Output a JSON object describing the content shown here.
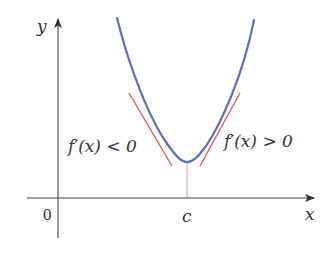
{
  "diagram": {
    "type": "function-graph",
    "axes": {
      "x_label": "x",
      "y_label": "y",
      "origin_label": "0"
    },
    "point_labels": {
      "critical_point": "c"
    },
    "annotations": {
      "left": "f′(x) < 0",
      "right": "f′(x) > 0"
    },
    "colors": {
      "curve": "#5a6fc0",
      "tangent": "#e8504a",
      "axis": "#444444",
      "guide": "#aaaaaa",
      "text": "#333333"
    }
  }
}
